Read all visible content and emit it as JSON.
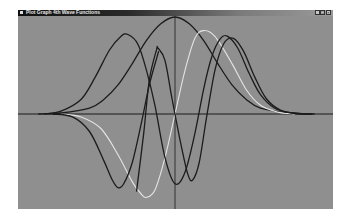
{
  "window": {
    "title": "Plot Graph 4th Wave Functions",
    "icon": "app-icon",
    "controls": [
      {
        "name": "minimize",
        "glyph": "_"
      },
      {
        "name": "maximize",
        "glyph": "□"
      },
      {
        "name": "close",
        "glyph": "×"
      }
    ]
  },
  "colors": {
    "background": "#8f8f8f",
    "axis": "#1a1a1a",
    "dark_curve": "#1c1c1c",
    "light_curve": "#e4e4e4"
  },
  "chart_data": {
    "type": "line",
    "title": "",
    "xlabel": "",
    "ylabel": "",
    "xlim": [
      -5.2,
      5.2
    ],
    "ylim": [
      -1.0,
      1.0
    ],
    "grid": false,
    "axes_through_origin": true,
    "series": [
      {
        "name": "curve-gaussian",
        "color": "dark",
        "points": [
          [
            -4.8,
            0
          ],
          [
            -4,
            0.01
          ],
          [
            -3,
            0.06
          ],
          [
            -2.5,
            0.15
          ],
          [
            -2,
            0.3
          ],
          [
            -1.5,
            0.52
          ],
          [
            -1,
            0.76
          ],
          [
            -0.5,
            0.93
          ],
          [
            0,
            1.0
          ],
          [
            0.5,
            0.93
          ],
          [
            1,
            0.76
          ],
          [
            1.5,
            0.52
          ],
          [
            2,
            0.3
          ],
          [
            2.5,
            0.15
          ],
          [
            3,
            0.06
          ],
          [
            4,
            0.01
          ],
          [
            4.8,
            0
          ]
        ]
      },
      {
        "name": "curve-light-odd",
        "color": "light",
        "points": [
          [
            -4.0,
            0
          ],
          [
            -3.3,
            -0.03
          ],
          [
            -2.6,
            -0.15
          ],
          [
            -2,
            -0.42
          ],
          [
            -1.5,
            -0.7
          ],
          [
            -1.2,
            -0.82
          ],
          [
            -1.0,
            -0.86
          ],
          [
            -0.7,
            -0.78
          ],
          [
            -0.35,
            -0.45
          ],
          [
            0,
            0
          ],
          [
            0.35,
            0.45
          ],
          [
            0.7,
            0.78
          ],
          [
            1.0,
            0.86
          ],
          [
            1.4,
            0.8
          ],
          [
            2,
            0.52
          ],
          [
            2.5,
            0.25
          ],
          [
            3,
            0.09
          ],
          [
            3.6,
            0.02
          ],
          [
            4.2,
            0
          ]
        ]
      },
      {
        "name": "curve-dark-odd",
        "color": "dark",
        "points": [
          [
            -4.3,
            0
          ],
          [
            -3.6,
            -0.03
          ],
          [
            -3,
            -0.18
          ],
          [
            -2.5,
            -0.48
          ],
          [
            -2.2,
            -0.68
          ],
          [
            -2.0,
            -0.76
          ],
          [
            -1.8,
            -0.72
          ],
          [
            -1.5,
            -0.5
          ],
          [
            -1.2,
            -0.12
          ],
          [
            -0.9,
            0.3
          ],
          [
            -0.6,
            0.62
          ],
          [
            -0.6,
            0.62
          ]
        ]
      },
      {
        "name": "curve-dark-left-peak",
        "color": "dark",
        "points": [
          [
            -4.6,
            0
          ],
          [
            -4,
            0.03
          ],
          [
            -3.3,
            0.15
          ],
          [
            -2.8,
            0.38
          ],
          [
            -2.3,
            0.66
          ],
          [
            -1.9,
            0.8
          ],
          [
            -1.65,
            0.82
          ],
          [
            -1.3,
            0.72
          ],
          [
            -1,
            0.45
          ],
          [
            -0.7,
            0.08
          ],
          [
            -0.35,
            -0.45
          ],
          [
            0,
            -0.72
          ],
          [
            0.35,
            -0.6
          ],
          [
            0.7,
            -0.2
          ],
          [
            1.0,
            0.25
          ],
          [
            1.3,
            0.6
          ],
          [
            1.6,
            0.78
          ],
          [
            1.85,
            0.8
          ],
          [
            2.2,
            0.68
          ],
          [
            2.6,
            0.42
          ],
          [
            3,
            0.2
          ],
          [
            3.5,
            0.06
          ],
          [
            4.1,
            0.01
          ],
          [
            4.8,
            0
          ]
        ]
      },
      {
        "name": "curve-dark-narrow",
        "color": "dark",
        "points": [
          [
            -1.35,
            -0.8
          ],
          [
            -1.1,
            -0.2
          ],
          [
            -0.9,
            0.35
          ],
          [
            -0.65,
            0.66
          ],
          [
            -0.6,
            0.68
          ],
          [
            -0.35,
            0.55
          ],
          [
            -0.1,
            0.15
          ],
          [
            0.2,
            -0.3
          ],
          [
            0.45,
            -0.62
          ],
          [
            0.62,
            -0.68
          ],
          [
            0.85,
            -0.5
          ],
          [
            1.1,
            -0.05
          ],
          [
            1.4,
            0.45
          ],
          [
            1.7,
            0.72
          ],
          [
            2.05,
            0.78
          ],
          [
            2.4,
            0.65
          ],
          [
            2.8,
            0.38
          ],
          [
            3.2,
            0.16
          ],
          [
            3.7,
            0.04
          ],
          [
            4.3,
            0.005
          ],
          [
            4.9,
            0
          ]
        ]
      }
    ]
  }
}
